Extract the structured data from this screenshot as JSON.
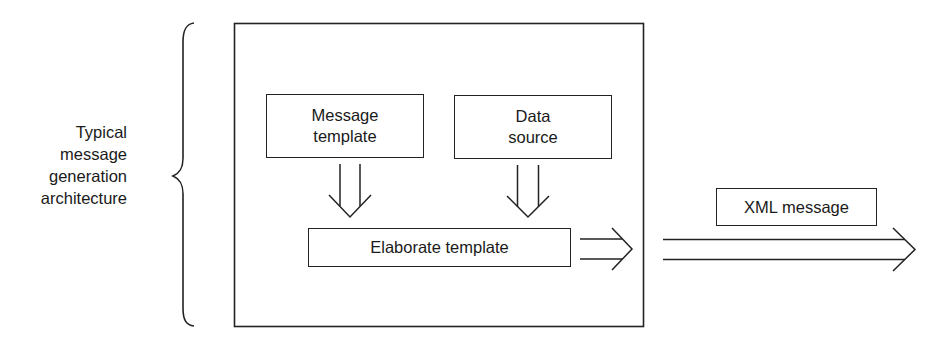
{
  "diagram": {
    "side_label": "Typical\nmessage\ngeneration\narchitecture",
    "container_box": {
      "label": ""
    },
    "nodes": [
      {
        "id": "message-template",
        "label": "Message\ntemplate"
      },
      {
        "id": "data-source",
        "label": "Data\nsource"
      },
      {
        "id": "elaborate-template",
        "label": "Elaborate template"
      },
      {
        "id": "xml-message",
        "label": "XML message"
      }
    ],
    "edges": [
      {
        "from": "message-template",
        "to": "elaborate-template",
        "style": "hollow-double-arrow"
      },
      {
        "from": "data-source",
        "to": "elaborate-template",
        "style": "hollow-double-arrow"
      },
      {
        "from": "elaborate-template",
        "to": "xml-message",
        "style": "hollow-double-arrow"
      }
    ],
    "stroke_color": "#222222",
    "background_color": "#ffffff"
  }
}
